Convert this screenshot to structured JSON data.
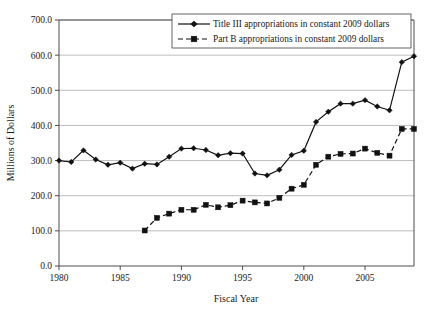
{
  "chart_data": {
    "type": "line",
    "title": "",
    "xlabel": "Fiscal Year",
    "ylabel": "Millions of Dollars",
    "xlim": [
      1980,
      2009
    ],
    "ylim": [
      0,
      700
    ],
    "yticks": [
      0,
      100,
      200,
      300,
      400,
      500,
      600,
      700
    ],
    "ytick_labels": [
      "0.0",
      "100.0",
      "200.0",
      "300.0",
      "400.0",
      "500.0",
      "600.0",
      "700.0"
    ],
    "xticks": [
      1980,
      1985,
      1990,
      1995,
      2000,
      2005
    ],
    "xtick_labels": [
      "1980",
      "1985",
      "1990",
      "1995",
      "2000",
      "2005"
    ],
    "grid": "horizontal",
    "legend_position": "top-right",
    "series": [
      {
        "name": "Title III appropriations in constant 2009 dollars",
        "marker": "diamond",
        "line_style": "solid",
        "color": "#111111",
        "x": [
          1980,
          1981,
          1982,
          1983,
          1984,
          1985,
          1986,
          1987,
          1988,
          1989,
          1990,
          1991,
          1992,
          1993,
          1994,
          1995,
          1996,
          1997,
          1998,
          1999,
          2000,
          2001,
          2002,
          2003,
          2004,
          2005,
          2006,
          2007,
          2008,
          2009
        ],
        "values": [
          300,
          296,
          329,
          303,
          288,
          294,
          277,
          291,
          289,
          311,
          334,
          335,
          330,
          315,
          321,
          320,
          263,
          258,
          274,
          316,
          328,
          410,
          439,
          462,
          462,
          472,
          454,
          443,
          580,
          597
        ]
      },
      {
        "name": "Part B appropriations in constant 2009 dollars",
        "marker": "square",
        "line_style": "dashed",
        "color": "#111111",
        "x": [
          1987,
          1988,
          1989,
          1990,
          1991,
          1992,
          1993,
          1994,
          1995,
          1996,
          1997,
          1998,
          1999,
          2000,
          2001,
          2002,
          2003,
          2004,
          2005,
          2006,
          2007,
          2008,
          2009
        ],
        "values": [
          101,
          137,
          149,
          160,
          160,
          174,
          167,
          173,
          186,
          181,
          178,
          194,
          220,
          231,
          288,
          311,
          319,
          320,
          334,
          322,
          314,
          390,
          390
        ]
      }
    ]
  },
  "axis": {
    "ylabel": "Millions of Dollars",
    "xlabel": "Fiscal Year"
  },
  "legend": {
    "entry_1": "Title III appropriations in constant 2009 dollars",
    "entry_2": "Part B appropriations in constant 2009 dollars"
  }
}
